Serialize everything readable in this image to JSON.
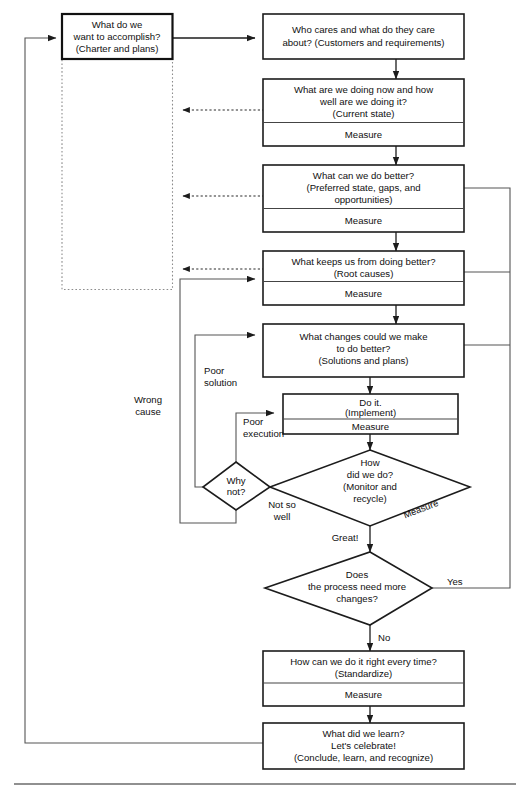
{
  "diagram": {
    "nodes": {
      "accomplish": {
        "lines": [
          "What do we",
          "want to accomplish?",
          "(Charter and plans)"
        ]
      },
      "who_cares": {
        "lines": [
          "Who cares and what do they care",
          "about? (Customers and requirements)"
        ]
      },
      "current_state": {
        "lines": [
          "What are we doing now and how",
          "well are we doing it?",
          "(Current state)"
        ],
        "measure": "Measure"
      },
      "do_better": {
        "lines": [
          "What can we do better?",
          "(Preferred state, gaps, and",
          "opportunities)"
        ],
        "measure": "Measure"
      },
      "root_causes": {
        "lines": [
          "What keeps us from doing better?",
          "(Root causes)"
        ],
        "measure": "Measure"
      },
      "changes": {
        "lines": [
          "What changes could we make",
          "to do better?",
          "(Solutions and plans)"
        ]
      },
      "do_it": {
        "lines": [
          "Do it.",
          "(Implement)"
        ],
        "measure": "Measure"
      },
      "how_did_we_do": {
        "lines": [
          "How",
          "did we do?",
          "(Monitor and",
          "recycle)"
        ],
        "edge_label": "Measure"
      },
      "why_not": {
        "lines": [
          "Why",
          "not?"
        ]
      },
      "more_changes": {
        "lines": [
          "Does",
          "the process need more",
          "changes?"
        ]
      },
      "standardize": {
        "lines": [
          "How can we do it right every time?",
          "(Standardize)"
        ],
        "measure": "Measure"
      },
      "learn": {
        "lines": [
          "What did we learn?",
          "Let's celebrate!",
          "(Conclude, learn, and recognize)"
        ]
      }
    },
    "edge_labels": {
      "wrong_cause": [
        "Wrong",
        "cause"
      ],
      "poor_solution": [
        "Poor",
        "solution"
      ],
      "poor_execution": [
        "Poor",
        "execution"
      ],
      "not_so_well": [
        "Not so",
        "well"
      ],
      "great": "Great!",
      "yes": "Yes",
      "no": "No"
    },
    "colors": {
      "stroke": "#1c1c1c",
      "background": "#ffffff",
      "dotted": "#8c8c8c",
      "rule": "#6b6b6b"
    }
  }
}
